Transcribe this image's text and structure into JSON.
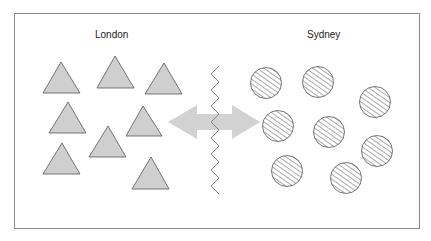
{
  "labels": {
    "left": "London",
    "right": "Sydney"
  },
  "colors": {
    "frame": "#8a8a8a",
    "triangle_fill": "#cfcfcf",
    "triangle_stroke": "#555555",
    "circle_stroke": "#555555",
    "hatch": "#555555",
    "arrow": "#d2d2d2",
    "zigzag": "#777777"
  },
  "left_group": {
    "shape": "triangle",
    "count": 8
  },
  "right_group": {
    "shape": "hatched-circle",
    "count": 8
  },
  "connector": {
    "type": "double-headed-arrow",
    "barrier": "zigzag-line"
  }
}
